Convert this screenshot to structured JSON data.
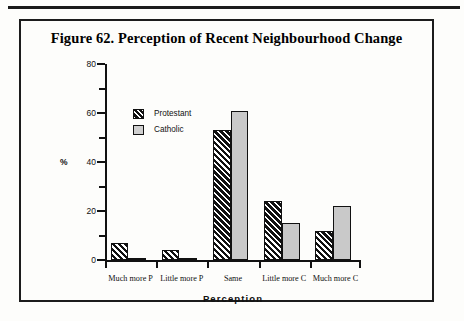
{
  "figure": {
    "title": "Figure 62. Perception of Recent Neighbourhood Change"
  },
  "chart_data": {
    "type": "bar",
    "title": "Figure 62. Perception of Recent Neighbourhood Change",
    "xlabel": "Perception",
    "ylabel": "%",
    "ylim": [
      0,
      80
    ],
    "yticks": [
      0,
      20,
      40,
      60,
      80
    ],
    "ytick_labels": [
      "0",
      "20",
      "40",
      "60",
      "80"
    ],
    "minor_ticks": [
      10,
      30,
      50,
      70
    ],
    "grid": false,
    "legend_position": "upper-left-inside",
    "categories": [
      "Much more P",
      "Little more P",
      "Same",
      "Little more C",
      "Much more C"
    ],
    "series": [
      {
        "name": "Protestant",
        "color": "#111111",
        "pattern": "diagonal-hatch",
        "values": [
          7,
          4,
          53,
          24,
          12
        ]
      },
      {
        "name": "Catholic",
        "color": "#c9c9c9",
        "pattern": "solid-grey",
        "values": [
          1,
          1,
          61,
          15,
          22
        ]
      }
    ]
  }
}
